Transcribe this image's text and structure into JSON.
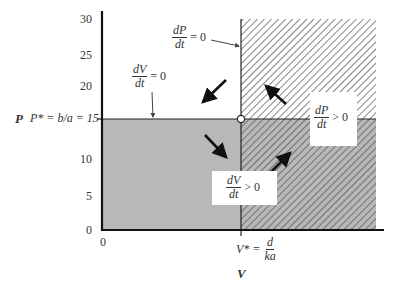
{
  "diagram": {
    "type": "phase-plane",
    "axes": {
      "y_label": "P",
      "x_label": "V",
      "y_ticks": [
        "30",
        "25",
        "20",
        "15",
        "10",
        "5",
        "0"
      ],
      "x_ticks": [
        "0"
      ],
      "y_equilibrium_label": "P* = b/a = 15",
      "x_equilibrium_label_lhs": "V* =",
      "x_equilibrium_num": "d",
      "x_equilibrium_den": "ka"
    },
    "isoclines": {
      "dP_dt_zero": {
        "num": "dP",
        "den": "dt",
        "rest": "= 0"
      },
      "dV_dt_zero": {
        "num": "dV",
        "den": "dt",
        "rest": "= 0"
      }
    },
    "region_labels": {
      "dP_dt_positive": {
        "num": "dP",
        "den": "dt",
        "rest": "> 0"
      },
      "dV_dt_positive": {
        "num": "dV",
        "den": "dt",
        "rest": "> 0"
      }
    },
    "colors": {
      "axis": "#111111",
      "shaded_fill": "#b8b8b8",
      "hatch_line": "#555555",
      "arrow": "#111111",
      "white_box": "#ffffff"
    },
    "regions": [
      {
        "name": "lower-left",
        "shaded": true,
        "hatched": false,
        "arrow": "down-right"
      },
      {
        "name": "upper-left",
        "shaded": false,
        "hatched": false,
        "arrow": "down-left"
      },
      {
        "name": "upper-right",
        "shaded": false,
        "hatched": true,
        "arrow": "up-left"
      },
      {
        "name": "lower-right",
        "shaded": true,
        "hatched": true,
        "arrow": "up-right"
      }
    ]
  }
}
